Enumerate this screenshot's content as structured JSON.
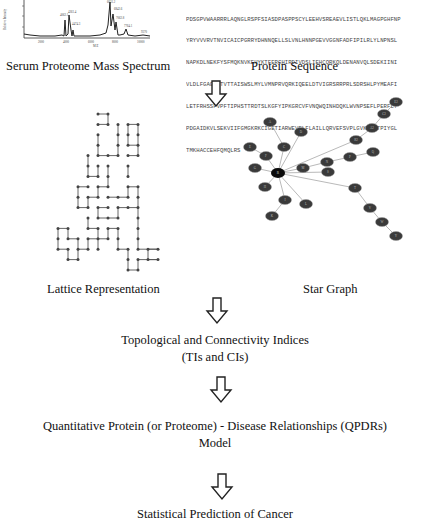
{
  "top": {
    "spectrum": {
      "caption": "Serum Proteome Mass Spectrum",
      "x_ticks": [
        "2000",
        "4000",
        "6000",
        "8000",
        "10000"
      ],
      "xlabel": "M/Z",
      "ylabel": "Relative Intensity",
      "peak_labels": [
        "4062.1",
        "4261.4",
        "4474.3",
        "6631.2",
        "6842.6",
        "7062.8",
        "7764.1",
        "9370"
      ]
    },
    "sequence": {
      "caption": "Protein Sequence",
      "lines": [
        "PDSGPVWAARRRLAQNGLRSPFSIASDPASPPSCYLEEHVSREAEVLISTLQKLMAGPGHFNP",
        "YRYVVVRVTNVICAICPGRRYDHNNQELLSLVNLHNNPGEVVGGNFADFIPILRLYLNPNSL",
        "NAPKDLNEKFYSFMQKNVKEHYKTFERGHIRDIVDSLIEHCQRKQLDENANVQLSDEKIINI",
        "VLDLFGAGFDTVTTAISWSLMYLVMNPRVQRKIQEELDTVIGRSRRPRLSDRSHLPYMEAFI",
        "LETFRHSSFVPFTIPHSTTRDTSLKGFYIPKGRCVFVNQWQINHDQKLWVNPSEFLPERFLT",
        "PDGAIDKVLSEKVIIFGMGKRKCIGETIARWEVFLFLAILLQRVEFSVPLGVKVDMTPIYGL",
        "TMKHACCEHFQMQLRS"
      ]
    }
  },
  "middle": {
    "lattice_caption": "Lattice Representation",
    "star_caption": "Star Graph",
    "star_center_label": "R",
    "star_node_labels": [
      "A",
      "C",
      "D",
      "E",
      "F",
      "G",
      "H",
      "I",
      "K",
      "L",
      "M",
      "N",
      "P",
      "Q",
      "S",
      "T",
      "V",
      "W",
      "Y",
      "R2",
      "A2",
      "C2",
      "E2",
      "G2",
      "K2"
    ]
  },
  "stages": [
    {
      "line1": "Topological and Connectivity Indices",
      "line2": "(TIs and CIs)"
    },
    {
      "line1": "Quantitative Protein (or Proteome) - Disease Relationships (QPDRs)",
      "line2": "Model"
    },
    {
      "line1": "Statistical Prediction of Cancer",
      "line2": ""
    }
  ],
  "colors": {
    "node_fill": "#3a3a3a",
    "center_fill": "#0a0a0a",
    "edge": "#8a8a8a",
    "lattice": "#555555",
    "arrow": "#222222"
  }
}
